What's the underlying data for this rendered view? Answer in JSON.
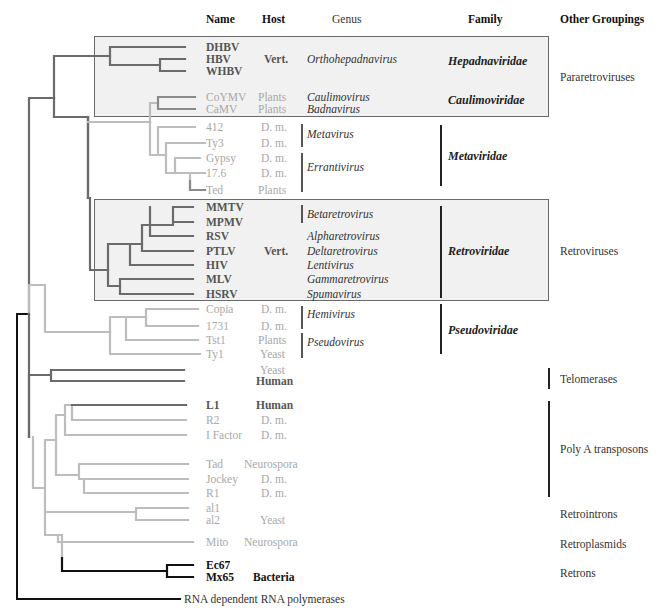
{
  "headers": {
    "name": "Name",
    "host": "Host",
    "genus": "Genus",
    "family": "Family",
    "other": "Other Groupings"
  },
  "colors": {
    "dark_branch": "#6b6b6b",
    "light_branch": "#bdbdbd",
    "black_branch": "#111111",
    "box_fill": "#f1f1f1",
    "box_border": "#6a6a6a"
  },
  "leaves": [
    {
      "name": "DHBV",
      "host": "",
      "style": "dark",
      "y": 47
    },
    {
      "name": "HBV",
      "host": "Vert.",
      "style": "dark",
      "y": 59
    },
    {
      "name": "WHBV",
      "host": "",
      "style": "dark",
      "y": 71
    },
    {
      "name": "CoYMV",
      "host": "Plants",
      "style": "light",
      "y": 97
    },
    {
      "name": "CaMV",
      "host": "Plants",
      "style": "light",
      "y": 109
    },
    {
      "name": "412",
      "host": "D. m.",
      "style": "light",
      "y": 127
    },
    {
      "name": "Ty3",
      "host": "D. m.",
      "style": "light",
      "y": 143
    },
    {
      "name": "Gypsy",
      "host": "D. m.",
      "style": "light",
      "y": 158
    },
    {
      "name": "17.6",
      "host": "D. m.",
      "style": "light",
      "y": 173
    },
    {
      "name": "Ted",
      "host": "Plants",
      "style": "light",
      "y": 190
    },
    {
      "name": "MMTV",
      "host": "",
      "style": "dark",
      "y": 207
    },
    {
      "name": "MPMV",
      "host": "",
      "style": "dark",
      "y": 222
    },
    {
      "name": "RSV",
      "host": "",
      "style": "dark",
      "y": 236
    },
    {
      "name": "PTLV",
      "host": "Vert.",
      "style": "dark",
      "y": 251
    },
    {
      "name": "HIV",
      "host": "",
      "style": "dark",
      "y": 265
    },
    {
      "name": "MLV",
      "host": "",
      "style": "dark",
      "y": 279
    },
    {
      "name": "HSRV",
      "host": "",
      "style": "dark",
      "y": 294
    },
    {
      "name": "Copia",
      "host": "D. m.",
      "style": "light",
      "y": 309
    },
    {
      "name": "1731",
      "host": "D. m.",
      "style": "light",
      "y": 326
    },
    {
      "name": "Tst1",
      "host": "Plants",
      "style": "light",
      "y": 340
    },
    {
      "name": "Ty1",
      "host": "Yeast",
      "style": "light",
      "y": 354
    },
    {
      "name": "",
      "host": "Yeast",
      "style": "light",
      "y": 370
    },
    {
      "name": "",
      "host": "Human",
      "style": "dark",
      "y": 381
    },
    {
      "name": "L1",
      "host": "Human",
      "style": "dark",
      "y": 405
    },
    {
      "name": "R2",
      "host": "D. m.",
      "style": "light",
      "y": 420
    },
    {
      "name": "I Factor",
      "host": "D. m.",
      "style": "light",
      "y": 435
    },
    {
      "name": "Tad",
      "host": "Neurospora",
      "style": "light",
      "y": 464
    },
    {
      "name": "Jockey",
      "host": "D. m.",
      "style": "light",
      "y": 479
    },
    {
      "name": "R1",
      "host": "D. m.",
      "style": "light",
      "y": 493
    },
    {
      "name": "al1",
      "host": "",
      "style": "light",
      "y": 508
    },
    {
      "name": "al2",
      "host": "Yeast",
      "style": "light",
      "y": 520
    },
    {
      "name": "Mito",
      "host": "Neurospora",
      "style": "light",
      "y": 542
    },
    {
      "name": "Ec67",
      "host": "",
      "style": "black",
      "y": 565
    },
    {
      "name": "Mx65",
      "host": "Bacteria",
      "style": "black",
      "y": 577
    }
  ],
  "genera": [
    {
      "label": "Orthohepadnavirus",
      "y": 59
    },
    {
      "label": "Caulimovirus",
      "y": 97
    },
    {
      "label": "Badnavirus",
      "y": 109
    },
    {
      "label": "Metavirus",
      "y": 134
    },
    {
      "label": "Errantivirus",
      "y": 167
    },
    {
      "label": "Betaretrovirus",
      "y": 214
    },
    {
      "label": "Alpharetrovirus",
      "y": 236
    },
    {
      "label": "Deltaretrovirus",
      "y": 251
    },
    {
      "label": "Lentivirus",
      "y": 265
    },
    {
      "label": "Gammaretrovirus",
      "y": 279
    },
    {
      "label": "Spumavirus",
      "y": 294
    },
    {
      "label": "Hemivirus",
      "y": 314
    },
    {
      "label": "Pseudovirus",
      "y": 342
    }
  ],
  "families": [
    {
      "label": "Hepadnaviridae",
      "y": 61
    },
    {
      "label": "Caulimoviridae",
      "y": 100
    },
    {
      "label": "Metaviridae",
      "y": 156
    },
    {
      "label": "Retroviridae",
      "y": 251
    },
    {
      "label": "Pseudoviridae",
      "y": 330
    }
  ],
  "other_groupings": [
    {
      "label": "Pararetroviruses",
      "y": 77
    },
    {
      "label": "Retroviruses",
      "y": 251
    },
    {
      "label": "Telomerases",
      "y": 379
    },
    {
      "label": "Poly A transposons",
      "y": 449
    },
    {
      "label": "Retrointrons",
      "y": 514
    },
    {
      "label": "Retroplasmids",
      "y": 544
    },
    {
      "label": "Retrons",
      "y": 573
    }
  ],
  "outgroup": {
    "label": "RNA dependent RNA polymerases",
    "y": 599
  }
}
